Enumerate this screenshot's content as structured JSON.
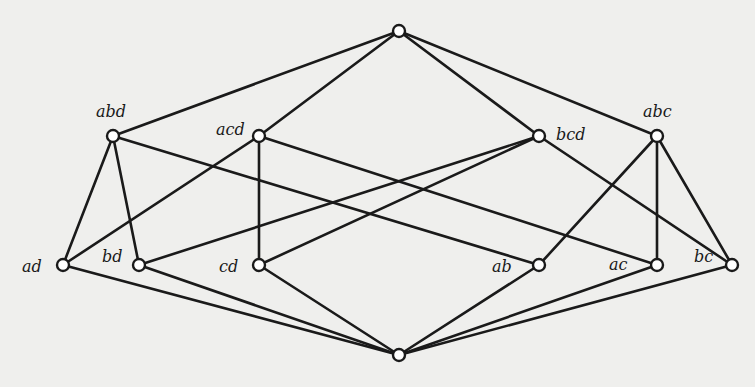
{
  "diagram": {
    "type": "lattice",
    "nodes": [
      {
        "id": "top",
        "label": "",
        "x": 399,
        "y": 31
      },
      {
        "id": "abd",
        "label": "abd",
        "x": 113,
        "y": 136,
        "lx": 96,
        "ly": 117
      },
      {
        "id": "acd",
        "label": "acd",
        "x": 259,
        "y": 136,
        "lx": 216,
        "ly": 135
      },
      {
        "id": "bcd",
        "label": "bcd",
        "x": 539,
        "y": 136,
        "lx": 556,
        "ly": 140
      },
      {
        "id": "abc",
        "label": "abc",
        "x": 657,
        "y": 136,
        "lx": 643,
        "ly": 117
      },
      {
        "id": "ad",
        "label": "ad",
        "x": 63,
        "y": 265,
        "lx": 22,
        "ly": 272
      },
      {
        "id": "bd",
        "label": "bd",
        "x": 139,
        "y": 265,
        "lx": 102,
        "ly": 262
      },
      {
        "id": "cd",
        "label": "cd",
        "x": 259,
        "y": 265,
        "lx": 219,
        "ly": 272
      },
      {
        "id": "ab",
        "label": "ab",
        "x": 539,
        "y": 265,
        "lx": 492,
        "ly": 272
      },
      {
        "id": "ac",
        "label": "ac",
        "x": 657,
        "y": 265,
        "lx": 609,
        "ly": 270
      },
      {
        "id": "bc",
        "label": "bc",
        "x": 732,
        "y": 265,
        "lx": 694,
        "ly": 262
      },
      {
        "id": "bottom",
        "label": "",
        "x": 399,
        "y": 355
      }
    ],
    "edges": [
      [
        "top",
        "abd"
      ],
      [
        "top",
        "acd"
      ],
      [
        "top",
        "bcd"
      ],
      [
        "top",
        "abc"
      ],
      [
        "abd",
        "ad"
      ],
      [
        "abd",
        "bd"
      ],
      [
        "abd",
        "ab"
      ],
      [
        "acd",
        "ad"
      ],
      [
        "acd",
        "cd"
      ],
      [
        "acd",
        "ac"
      ],
      [
        "bcd",
        "bd"
      ],
      [
        "bcd",
        "cd"
      ],
      [
        "bcd",
        "bc"
      ],
      [
        "abc",
        "ab"
      ],
      [
        "abc",
        "ac"
      ],
      [
        "abc",
        "bc"
      ],
      [
        "ad",
        "bottom"
      ],
      [
        "bd",
        "bottom"
      ],
      [
        "cd",
        "bottom"
      ],
      [
        "ab",
        "bottom"
      ],
      [
        "ac",
        "bottom"
      ],
      [
        "bc",
        "bottom"
      ]
    ],
    "colors": {
      "background": "#efefed",
      "line": "#1a1a1a",
      "node_fill": "#ffffff"
    }
  }
}
